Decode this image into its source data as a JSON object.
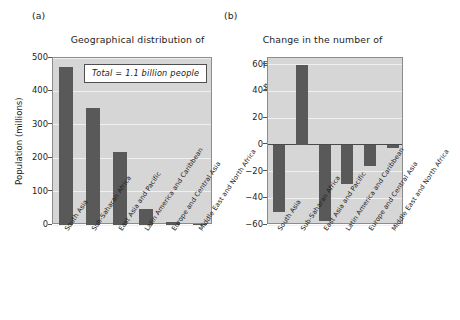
{
  "figure": {
    "panel_a": {
      "tag": "(a)",
      "title_lines": [
        "Geographical distribution of",
        "population living on less than",
        "$1 per day, 2007"
      ],
      "annotation": "Total = 1.1 billion people"
    },
    "panel_b": {
      "tag": "(b)",
      "title_lines": [
        "Change in the number of",
        "people living on less than",
        "$1 per day, 1998–2007"
      ]
    },
    "colors": {
      "bar": "#595959",
      "plot_background": "#d6d6d6",
      "gridline": "#f0f0f0",
      "axis": "#8c8c8c",
      "text": "#1c1c1c"
    }
  },
  "chart_data": [
    {
      "type": "bar",
      "panel": "(a)",
      "title": "(a) Geographical distribution of population living on less than $1 per day, 2007",
      "xlabel": "",
      "ylabel": "Population (millions)",
      "categories": [
        "South Asia",
        "Sub-Saharan Africa",
        "East Asia and Pacific",
        "Latin America and Caribbean",
        "Europe and Central Asia",
        "Middle East and North Africa"
      ],
      "values": [
        473,
        350,
        220,
        48,
        9,
        4
      ],
      "ylim": [
        0,
        500
      ],
      "yticks": [
        0,
        100,
        200,
        300,
        400,
        500
      ],
      "ytick_labels": [
        "0",
        "100",
        "200",
        "300",
        "400",
        "500"
      ],
      "grid": true,
      "legend": "none",
      "annotations": [
        "Total = 1.1 billion people"
      ]
    },
    {
      "type": "bar",
      "panel": "(b)",
      "title": "(b) Change in the number of people living on less than $1 per day, 1998–2007",
      "xlabel": "",
      "ylabel": "",
      "categories": [
        "South Asia",
        "Sub-Saharan Africa",
        "East Asia and Pacific",
        "Latin America and Caribbean",
        "Europe and Central Asia",
        "Middle East and North Africa"
      ],
      "values": [
        -50,
        60,
        -57,
        -29,
        -16,
        -2
      ],
      "ylim": [
        -60,
        65
      ],
      "yticks": [
        -60,
        -40,
        -20,
        0,
        20,
        40,
        60
      ],
      "ytick_labels": [
        "−60",
        "−40",
        "−20",
        "0",
        "20",
        "40",
        "60"
      ],
      "grid": true,
      "legend": "none",
      "annotations": []
    }
  ]
}
